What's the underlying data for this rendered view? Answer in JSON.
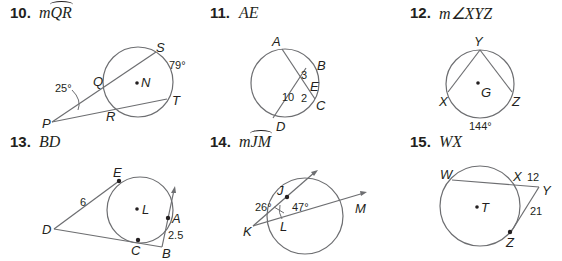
{
  "problems": [
    {
      "number": "10.",
      "prompt_prefix": "m",
      "prompt_arc": "QR",
      "find": "measure of arc QR",
      "labels": {
        "S": "S",
        "Q": "Q",
        "N": "N",
        "T": "T",
        "P": "P",
        "R": "R"
      },
      "values": {
        "angle_P": "25°",
        "arc_ST": "79°"
      }
    },
    {
      "number": "11.",
      "prompt": "AE",
      "find": "segment AE",
      "labels": {
        "A": "A",
        "B": "B",
        "E": "E",
        "C": "C",
        "D": "D"
      },
      "values": {
        "BE": "3",
        "EC": "2",
        "DE": "10"
      }
    },
    {
      "number": "12.",
      "prompt": "m∠XYZ",
      "find": "measure of angle XYZ",
      "labels": {
        "Y": "Y",
        "X": "X",
        "G": "G",
        "Z": "Z"
      },
      "values": {
        "arc_XZ": "144°"
      }
    },
    {
      "number": "13.",
      "prompt": "BD",
      "find": "segment BD",
      "labels": {
        "E": "E",
        "L": "L",
        "A": "A",
        "D": "D",
        "C": "C",
        "B": "B"
      },
      "values": {
        "DE": "6",
        "AB": "2.5"
      }
    },
    {
      "number": "14.",
      "prompt_prefix": "m",
      "prompt_arc": "JM",
      "find": "measure of arc JM",
      "labels": {
        "J": "J",
        "M": "M",
        "K": "K",
        "L": "L"
      },
      "values": {
        "angle_K": "26°",
        "angle_JLM": "47°"
      }
    },
    {
      "number": "15.",
      "prompt": "WX",
      "find": "segment WX",
      "labels": {
        "W": "W",
        "X": "X",
        "Y": "Y",
        "T": "T",
        "Z": "Z"
      },
      "values": {
        "XY": "12",
        "YZ": "21"
      }
    }
  ]
}
